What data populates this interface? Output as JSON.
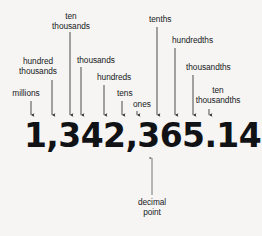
{
  "diagram": {
    "background_color": "#f6f5f3",
    "text_color": "#16191c",
    "number": "1,342,365.1427",
    "number_digits": [
      "1",
      ",",
      "3",
      "4",
      "2",
      ",",
      "3",
      "6",
      "5",
      ".",
      "1",
      "4",
      "2",
      "7"
    ],
    "labels": {
      "millions": "millions",
      "hundred_thousands_line1": "hundred",
      "hundred_thousands_line2": "thousands",
      "ten_thousands_line1": "ten",
      "ten_thousands_line2": "thousands",
      "thousands": "thousands",
      "hundreds": "hundreds",
      "tens": "tens",
      "ones": "ones",
      "tenths": "tenths",
      "hundredths": "hundredths",
      "thousandths": "thousandths",
      "ten_thousandths_line1": "ten",
      "ten_thousandths_line2": "thousandths",
      "decimal_point_line1": "decimal",
      "decimal_point_line2": "point"
    },
    "callouts": [
      {
        "name": "millions",
        "label": "millions",
        "digit": "1",
        "arrow_x": 31,
        "arrow_top": 101,
        "arrow_tip": 120
      },
      {
        "name": "hundred-thousands",
        "label": "hundred thousands",
        "digit": "3",
        "arrow_x": 52,
        "arrow_top": 80,
        "arrow_tip": 120
      },
      {
        "name": "ten-thousands",
        "label": "ten thousands",
        "digit": "4",
        "arrow_x": 70,
        "arrow_top": 32,
        "arrow_tip": 120
      },
      {
        "name": "thousands",
        "label": "thousands",
        "digit": "2",
        "arrow_x": 81,
        "arrow_top": 67,
        "arrow_tip": 120
      },
      {
        "name": "hundreds",
        "label": "hundreds",
        "digit": "3",
        "arrow_x": 104,
        "arrow_top": 85,
        "arrow_tip": 120
      },
      {
        "name": "tens",
        "label": "tens",
        "digit": "6",
        "arrow_x": 122,
        "arrow_top": 101,
        "arrow_tip": 120
      },
      {
        "name": "ones",
        "label": "ones",
        "digit": "5",
        "arrow_x": 137,
        "arrow_top": 112,
        "arrow_tip": 120
      },
      {
        "name": "tenths",
        "label": "tenths",
        "digit": "1",
        "arrow_x": 157,
        "arrow_top": 27,
        "arrow_tip": 120
      },
      {
        "name": "hundredths",
        "label": "hundredths",
        "digit": "4",
        "arrow_x": 175,
        "arrow_top": 48,
        "arrow_tip": 120
      },
      {
        "name": "thousandths",
        "label": "thousandths",
        "digit": "2",
        "arrow_x": 193,
        "arrow_top": 75,
        "arrow_tip": 120
      },
      {
        "name": "ten-thousandths",
        "label": "ten thousandths",
        "digit": "7",
        "arrow_x": 209,
        "arrow_top": 109,
        "arrow_tip": 120
      },
      {
        "name": "decimal-point",
        "label": "decimal point",
        "digit": ".",
        "arrow_x": 152,
        "arrow_top": 195,
        "arrow_tip": 154
      }
    ]
  }
}
